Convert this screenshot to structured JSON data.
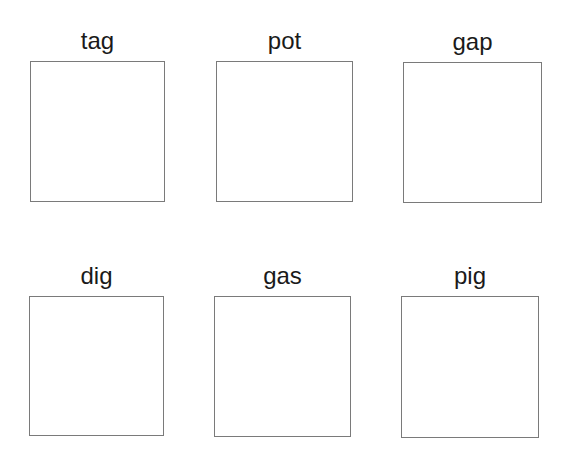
{
  "worksheet": {
    "cells": [
      {
        "word": "tag"
      },
      {
        "word": "pot"
      },
      {
        "word": "gap"
      },
      {
        "word": "dig"
      },
      {
        "word": "gas"
      },
      {
        "word": "pig"
      }
    ]
  },
  "colors": {
    "text": "#1a1a1a",
    "box_border": "#7a7a7a",
    "background": "#ffffff"
  }
}
